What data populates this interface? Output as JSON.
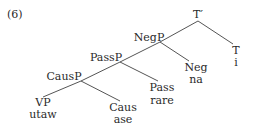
{
  "example_number": "(6)",
  "tree": {
    "nodes": {
      "t_bar": {
        "label": "T′"
      },
      "negp": {
        "label": "NegP"
      },
      "t": {
        "label": "T",
        "gloss": "i"
      },
      "passp": {
        "label": "PassP"
      },
      "neg": {
        "label": "Neg",
        "gloss": "na"
      },
      "causp": {
        "label": "CausP"
      },
      "pass": {
        "label": "Pass",
        "gloss": "rare"
      },
      "vp": {
        "label": "VP",
        "gloss": "utaw"
      },
      "caus": {
        "label": "Caus",
        "gloss": "ase"
      }
    },
    "edges": [
      [
        "t_bar",
        "negp"
      ],
      [
        "t_bar",
        "t"
      ],
      [
        "negp",
        "passp"
      ],
      [
        "negp",
        "neg"
      ],
      [
        "passp",
        "causp"
      ],
      [
        "passp",
        "pass"
      ],
      [
        "causp",
        "vp"
      ],
      [
        "causp",
        "caus"
      ]
    ]
  }
}
